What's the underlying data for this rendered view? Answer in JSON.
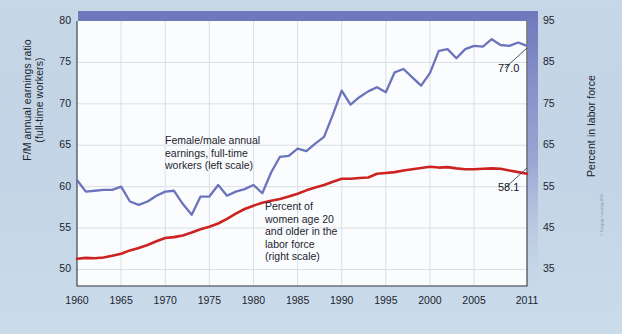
{
  "chart_data": {
    "type": "line",
    "title": "",
    "xlabel": "",
    "ylabel": "F/M annual earnings ratio\n(full-time workers)",
    "ylabel_right": "Percent in labor force",
    "xlim": [
      1960,
      2011
    ],
    "ylim": [
      48,
      80
    ],
    "ylim_right": [
      31,
      95
    ],
    "yticks": [
      50,
      55,
      60,
      65,
      70,
      75,
      80
    ],
    "yticks_right": [
      35,
      45,
      55,
      65,
      75,
      85,
      95
    ],
    "xticks": [
      1960,
      1965,
      1970,
      1975,
      1980,
      1985,
      1990,
      1995,
      2000,
      2005,
      2011
    ],
    "grid": true,
    "legend_position": "inline-annotations",
    "series": [
      {
        "name": "Female/male annual earnings, full-time workers (left scale)",
        "axis": "left",
        "color": "#6b73bd",
        "annotation": "Female/male annual\nearnings, full-time\nworkers (left scale)",
        "end_label": "77.0",
        "x": [
          1960,
          1961,
          1962,
          1963,
          1964,
          1965,
          1966,
          1967,
          1968,
          1969,
          1970,
          1971,
          1972,
          1973,
          1974,
          1975,
          1976,
          1977,
          1978,
          1979,
          1980,
          1981,
          1982,
          1983,
          1984,
          1985,
          1986,
          1987,
          1988,
          1989,
          1990,
          1991,
          1992,
          1993,
          1994,
          1995,
          1996,
          1997,
          1998,
          1999,
          2000,
          2001,
          2002,
          2003,
          2004,
          2005,
          2006,
          2007,
          2008,
          2009,
          2010,
          2011
        ],
        "y": [
          60.8,
          59.4,
          59.5,
          59.6,
          59.6,
          60.0,
          58.2,
          57.8,
          58.2,
          58.9,
          59.4,
          59.5,
          57.9,
          56.6,
          58.8,
          58.8,
          60.2,
          58.9,
          59.4,
          59.7,
          60.2,
          59.2,
          61.7,
          63.6,
          63.7,
          64.6,
          64.3,
          65.2,
          66.0,
          68.7,
          71.6,
          69.9,
          70.8,
          71.5,
          72.0,
          71.4,
          73.8,
          74.2,
          73.2,
          72.2,
          73.7,
          76.4,
          76.6,
          75.5,
          76.6,
          77.0,
          76.9,
          77.8,
          77.1,
          77.0,
          77.4,
          77.0
        ]
      },
      {
        "name": "Percent of women age 20 and older in the labor force (right scale)",
        "axis": "right",
        "color": "#cc2222",
        "annotation": "Percent of\nwomen age 20\nand older in the\nlabor force\n(right scale)",
        "end_label": "58.1",
        "x": [
          1960,
          1961,
          1962,
          1963,
          1964,
          1965,
          1966,
          1967,
          1968,
          1969,
          1970,
          1971,
          1972,
          1973,
          1974,
          1975,
          1976,
          1977,
          1978,
          1979,
          1980,
          1981,
          1982,
          1983,
          1984,
          1985,
          1986,
          1987,
          1988,
          1989,
          1990,
          1991,
          1992,
          1993,
          1994,
          1995,
          1996,
          1997,
          1998,
          1999,
          2000,
          2001,
          2002,
          2003,
          2004,
          2005,
          2006,
          2007,
          2008,
          2009,
          2010,
          2011
        ],
        "y": [
          37.6,
          37.8,
          37.7,
          37.9,
          38.3,
          38.8,
          39.6,
          40.2,
          40.9,
          41.8,
          42.6,
          42.8,
          43.2,
          43.9,
          44.7,
          45.3,
          46.1,
          47.2,
          48.5,
          49.6,
          50.4,
          51.1,
          51.6,
          52.0,
          52.6,
          53.3,
          54.1,
          54.8,
          55.4,
          56.2,
          56.9,
          56.9,
          57.1,
          57.2,
          58.1,
          58.3,
          58.5,
          58.9,
          59.2,
          59.5,
          59.8,
          59.6,
          59.7,
          59.4,
          59.2,
          59.2,
          59.3,
          59.4,
          59.3,
          58.9,
          58.5,
          58.1
        ]
      }
    ]
  },
  "axes": {
    "left_title": "F/M annual earnings ratio\n(full-time workers)",
    "right_title": "Percent in labor force"
  },
  "edge_credit": "© Cengage Learning 2013"
}
